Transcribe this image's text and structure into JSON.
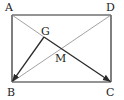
{
  "diagram": {
    "type": "geometry",
    "shape": "rectangle",
    "colors": {
      "background": "#ffffff",
      "edge": "#2a2a2a",
      "thin_line": "#8a8a8a",
      "vector": "#2a2a2a",
      "label": "#222222"
    },
    "points": {
      "A": {
        "label": "A",
        "x": 12,
        "y": 15
      },
      "D": {
        "label": "D",
        "x": 111,
        "y": 15
      },
      "B": {
        "label": "B",
        "x": 12,
        "y": 82
      },
      "C": {
        "label": "C",
        "x": 111,
        "y": 82
      },
      "G": {
        "label": "G",
        "x": 44,
        "y": 37
      },
      "M": {
        "label": "M",
        "x": 61.5,
        "y": 48.5
      }
    },
    "labels": {
      "A": "A",
      "B": "B",
      "C": "C",
      "D": "D",
      "G": "G",
      "M": "M"
    },
    "segments": [
      {
        "from": "A",
        "to": "D",
        "style": "edge"
      },
      {
        "from": "D",
        "to": "C",
        "style": "edge"
      },
      {
        "from": "C",
        "to": "B",
        "style": "edge"
      },
      {
        "from": "B",
        "to": "A",
        "style": "edge"
      },
      {
        "from": "A",
        "to": "G",
        "style": "thin"
      },
      {
        "from": "B",
        "to": "D",
        "style": "thin"
      }
    ],
    "vectors": [
      {
        "from": "G",
        "to": "C",
        "arrow_at": "C"
      },
      {
        "from": "G",
        "to": "B",
        "arrow_at": "B"
      }
    ]
  }
}
